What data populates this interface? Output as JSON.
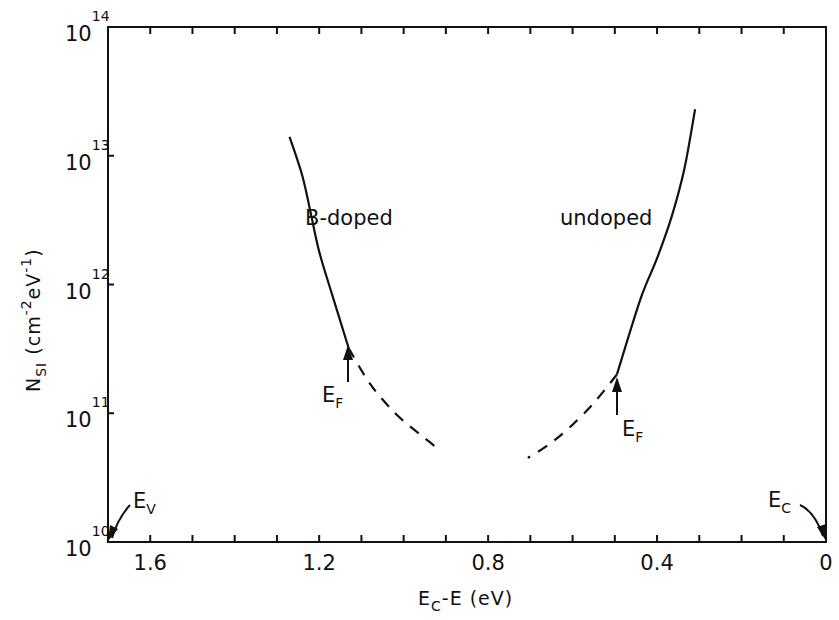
{
  "chart_data": {
    "type": "line",
    "title": "",
    "xlabel": "E_C - E (eV)",
    "xlabel_parts": {
      "main": "E",
      "sub": "C",
      "rest": "-E (eV)"
    },
    "ylabel": "N_SI (cm^-2 eV^-1)",
    "ylabel_parts": {
      "main": "N",
      "sub": "SI",
      "rest": " (cm",
      "exp1": "-2",
      "mid": "eV",
      "exp2": "-1",
      "close": ")"
    },
    "x_axis": {
      "range": [
        1.7,
        0
      ],
      "reversed": true,
      "major_ticks": [
        1.6,
        1.2,
        0.8,
        0.4,
        0
      ],
      "major_tick_labels": [
        "1.6",
        "1.2",
        "0.8",
        "0.4",
        "0"
      ],
      "minor_tick_step": 0.1
    },
    "y_axis": {
      "scale": "log",
      "range": [
        10000000000.0,
        100000000000000.0
      ],
      "ticks": [
        10,
        11,
        12,
        13,
        14
      ],
      "tick_base": "10",
      "tick_exponents": [
        "10",
        "11",
        "12",
        "13",
        "14"
      ]
    },
    "grid": false,
    "legend": null,
    "series": [
      {
        "name": "B-doped",
        "label": "B-doped",
        "style": "solid",
        "points": [
          [
            1.27,
            14000000000000.0
          ],
          [
            1.24,
            7000000000000.0
          ],
          [
            1.22,
            3600000000000.0
          ],
          [
            1.2,
            1800000000000.0
          ],
          [
            1.17,
            850000000000.0
          ],
          [
            1.13,
            320000000000.0
          ]
        ]
      },
      {
        "name": "B-doped (extrapolated)",
        "style": "dashed",
        "points": [
          [
            1.13,
            320000000000.0
          ],
          [
            1.08,
            170000000000.0
          ],
          [
            1.02,
            100000000000.0
          ],
          [
            0.96,
            68000000000.0
          ],
          [
            0.915,
            52000000000.0
          ]
        ]
      },
      {
        "name": "undoped",
        "label": "undoped",
        "style": "solid",
        "points": [
          [
            0.31,
            23000000000000.0
          ],
          [
            0.335,
            8000000000000.0
          ],
          [
            0.365,
            3400000000000.0
          ],
          [
            0.4,
            1600000000000.0
          ],
          [
            0.44,
            760000000000.0
          ],
          [
            0.495,
            200000000000.0
          ]
        ]
      },
      {
        "name": "undoped (extrapolated)",
        "style": "dashed",
        "points": [
          [
            0.495,
            200000000000.0
          ],
          [
            0.55,
            120000000000.0
          ],
          [
            0.61,
            76000000000.0
          ],
          [
            0.66,
            56000000000.0
          ],
          [
            0.706,
            45000000000.0
          ]
        ]
      }
    ],
    "annotations": [
      {
        "text": "B-doped",
        "x": 1.08,
        "y": 3200000000000.0
      },
      {
        "text": "undoped",
        "x": 0.5,
        "y": 3200000000000.0
      },
      {
        "text": "E_F",
        "main": "E",
        "sub": "F",
        "arrow_to": [
          1.13,
          320000000000.0
        ],
        "note": "Fermi level, B-doped"
      },
      {
        "text": "E_F",
        "main": "E",
        "sub": "F",
        "arrow_to": [
          0.495,
          200000000000.0
        ],
        "note": "Fermi level, undoped"
      },
      {
        "text": "E_V",
        "main": "E",
        "sub": "V",
        "arrow_to": [
          1.7,
          10000000000.0
        ],
        "note": "valence band edge"
      },
      {
        "text": "E_C",
        "main": "E",
        "sub": "C",
        "arrow_to": [
          0,
          10000000000.0
        ],
        "note": "conduction band edge"
      }
    ]
  },
  "labels": {
    "b_doped": "B-doped",
    "undoped": "undoped",
    "ef_main": "E",
    "ef_sub": "F",
    "ev_main": "E",
    "ev_sub": "V",
    "ec_main": "E",
    "ec_sub": "C"
  },
  "colors": {
    "ink": "#111111",
    "background": "#ffffff"
  }
}
